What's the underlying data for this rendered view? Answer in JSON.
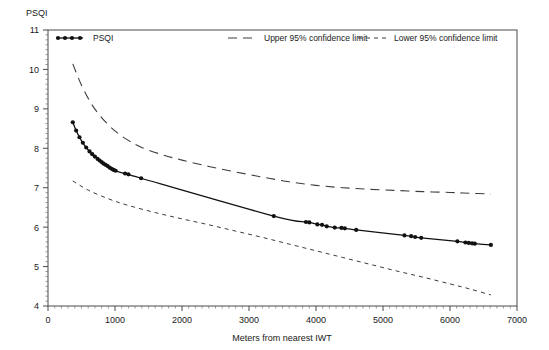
{
  "chart_data": {
    "type": "line",
    "title": "",
    "subtitle": "",
    "xlabel": "Meters from nearest IWT",
    "ylabel": "PSQI",
    "ylabel_position": "top-left",
    "xlim": [
      0,
      7000
    ],
    "ylim": [
      4,
      11
    ],
    "xticks": [
      0,
      1000,
      2000,
      3000,
      4000,
      5000,
      6000,
      7000
    ],
    "yticks": [
      4,
      5,
      6,
      7,
      8,
      9,
      10,
      11
    ],
    "xtick_labels": [
      "0",
      "1000",
      "2000",
      "3000",
      "4000",
      "5000",
      "6000",
      "7000"
    ],
    "ytick_labels": [
      "4",
      "5",
      "6",
      "7",
      "8",
      "9",
      "10",
      "11"
    ],
    "grid": false,
    "minor_ticks": true,
    "legend_position": "top-inside",
    "frame": "box",
    "series": [
      {
        "name": "PSQI",
        "style": "solid-with-markers",
        "color": "#111111",
        "points": [
          [
            370,
            8.66
          ],
          [
            420,
            8.45
          ],
          [
            470,
            8.28
          ],
          [
            520,
            8.14
          ],
          [
            570,
            8.02
          ],
          [
            620,
            7.92
          ],
          [
            660,
            7.85
          ],
          [
            700,
            7.79
          ],
          [
            740,
            7.73
          ],
          [
            770,
            7.69
          ],
          [
            800,
            7.65
          ],
          [
            830,
            7.61
          ],
          [
            860,
            7.58
          ],
          [
            890,
            7.55
          ],
          [
            920,
            7.51
          ],
          [
            950,
            7.48
          ],
          [
            980,
            7.45
          ],
          [
            1010,
            7.43
          ],
          [
            1150,
            7.36
          ],
          [
            1200,
            7.34
          ],
          [
            1390,
            7.24
          ],
          [
            3370,
            6.28
          ],
          [
            3850,
            6.13
          ],
          [
            3900,
            6.12
          ],
          [
            4020,
            6.07
          ],
          [
            4090,
            6.06
          ],
          [
            4160,
            6.02
          ],
          [
            4280,
            5.99
          ],
          [
            4380,
            5.98
          ],
          [
            4430,
            5.97
          ],
          [
            4600,
            5.93
          ],
          [
            5320,
            5.79
          ],
          [
            5420,
            5.77
          ],
          [
            5480,
            5.75
          ],
          [
            5570,
            5.73
          ],
          [
            6110,
            5.64
          ],
          [
            6230,
            5.61
          ],
          [
            6280,
            5.6
          ],
          [
            6330,
            5.59
          ],
          [
            6370,
            5.58
          ],
          [
            6610,
            5.55
          ]
        ]
      },
      {
        "name": "Upper 95% confidence limit",
        "style": "long-dashed",
        "color": "#3d3d3d",
        "points": [
          [
            370,
            10.14
          ],
          [
            500,
            9.6
          ],
          [
            650,
            9.12
          ],
          [
            800,
            8.78
          ],
          [
            1000,
            8.44
          ],
          [
            1200,
            8.2
          ],
          [
            1400,
            8.02
          ],
          [
            1700,
            7.84
          ],
          [
            2000,
            7.7
          ],
          [
            2400,
            7.54
          ],
          [
            2800,
            7.4
          ],
          [
            3200,
            7.27
          ],
          [
            3600,
            7.15
          ],
          [
            4000,
            7.06
          ],
          [
            4400,
            7.0
          ],
          [
            4800,
            6.96
          ],
          [
            5200,
            6.93
          ],
          [
            5600,
            6.9
          ],
          [
            6000,
            6.88
          ],
          [
            6300,
            6.86
          ],
          [
            6610,
            6.84
          ]
        ]
      },
      {
        "name": "Lower 95% confidence limit",
        "style": "short-dashed",
        "color": "#3d3d3d",
        "points": [
          [
            370,
            7.17
          ],
          [
            600,
            6.94
          ],
          [
            900,
            6.72
          ],
          [
            1200,
            6.55
          ],
          [
            1600,
            6.37
          ],
          [
            2000,
            6.21
          ],
          [
            2400,
            6.06
          ],
          [
            2800,
            5.9
          ],
          [
            3200,
            5.74
          ],
          [
            3600,
            5.57
          ],
          [
            4000,
            5.4
          ],
          [
            4400,
            5.23
          ],
          [
            4800,
            5.06
          ],
          [
            5200,
            4.89
          ],
          [
            5600,
            4.73
          ],
          [
            6000,
            4.56
          ],
          [
            6300,
            4.43
          ],
          [
            6610,
            4.28
          ]
        ]
      }
    ],
    "legend": [
      {
        "label": "PSQI",
        "style": "solid-with-markers"
      },
      {
        "label": "Upper 95% confidence limit",
        "style": "long-dashed"
      },
      {
        "label": "Lower 95% confidence limit",
        "style": "short-dashed"
      }
    ]
  }
}
